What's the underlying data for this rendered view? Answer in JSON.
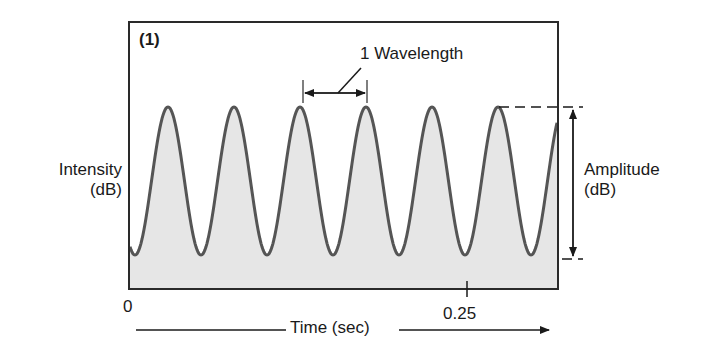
{
  "chart_data": {
    "type": "line",
    "title": "(1)",
    "panel_label": "(1)",
    "xlabel": "Time (sec)",
    "ylabel": "Intensity (dB)",
    "x_ticks": [
      {
        "label": "0",
        "value": 0
      },
      {
        "label": "0.25",
        "value": 0.25
      }
    ],
    "xlim": [
      0,
      0.29
    ],
    "grid": false,
    "legend": null,
    "series": [
      {
        "name": "Sound wave",
        "shape": "sinusoid",
        "cycles_visible": 6.5,
        "peaks_time_sec": [
          0.027,
          0.071,
          0.115,
          0.159,
          0.203,
          0.247,
          0.288
        ],
        "fill": "light gray under curve"
      }
    ],
    "annotations": [
      {
        "text": "1 Wavelength",
        "type": "bracket",
        "spans": "peak 3 to peak 4"
      },
      {
        "text": "Amplitude (dB)",
        "type": "vertical double arrow",
        "spans": "trough to peak"
      }
    ]
  },
  "labels": {
    "panel": "(1)",
    "ylabel_line1": "Intensity",
    "ylabel_line2": "(dB)",
    "amplitude_line1": "Amplitude",
    "amplitude_line2": "(dB)",
    "wavelength": "1 Wavelength",
    "tick_0": "0",
    "tick_025": "0.25",
    "xlabel": "Time (sec)"
  },
  "colors": {
    "curve": "#555555",
    "fill": "#e6e6e6",
    "frame": "#2a2a2a",
    "text": "#1a1a1a"
  }
}
